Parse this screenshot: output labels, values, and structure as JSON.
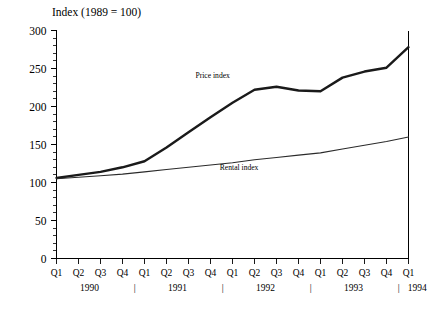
{
  "chart_data": {
    "type": "line",
    "title": "Index (1989 = 100)",
    "xlabel": "",
    "ylabel": "",
    "ylim": [
      0,
      300
    ],
    "ytick_step": 50,
    "yminor_step": 10,
    "grid": false,
    "legend_position": "inline-annotations",
    "categories": [
      "Q1 1990",
      "Q2 1990",
      "Q3 1990",
      "Q4 1990",
      "Q1 1991",
      "Q2 1991",
      "Q3 1991",
      "Q4 1991",
      "Q1 1992",
      "Q2 1992",
      "Q3 1992",
      "Q4 1992",
      "Q1 1993",
      "Q2 1993",
      "Q3 1993",
      "Q4 1993",
      "Q1 1994"
    ],
    "quarter_ticks": [
      "Q1",
      "Q2",
      "Q3",
      "Q4",
      "Q1",
      "Q2",
      "Q3",
      "Q4",
      "Q1",
      "Q2",
      "Q3",
      "Q4",
      "Q1",
      "Q2",
      "Q3",
      "Q4",
      "Q1"
    ],
    "yticks": [
      0,
      50,
      100,
      150,
      200,
      250,
      300
    ],
    "ytick_labels": [
      "0",
      "50",
      "100",
      "150",
      "200",
      "250",
      "300"
    ],
    "years": [
      {
        "label": "1990",
        "index": 1.5
      },
      {
        "label": "1991",
        "index": 5.5
      },
      {
        "label": "1992",
        "index": 9.5
      },
      {
        "label": "1993",
        "index": 13.5
      },
      {
        "label": "1994",
        "index": 16.4
      }
    ],
    "year_separators": [
      3.55,
      7.55,
      11.55,
      15.55
    ],
    "series": [
      {
        "name": "Price index",
        "color": "#1a1a1a",
        "linewidth": 2.4,
        "label_at_index": 7.1,
        "label_y_value": 238,
        "values": [
          106,
          110,
          114,
          120,
          128,
          146,
          166,
          186,
          205,
          222,
          226,
          221,
          220,
          238,
          246,
          251,
          278
        ]
      },
      {
        "name": "Rental index",
        "color": "#2a2a2a",
        "linewidth": 1.05,
        "label_at_index": 8.3,
        "label_y_value": 117,
        "values": [
          105,
          107,
          109,
          111,
          114,
          117,
          120,
          123,
          126,
          130,
          133,
          136,
          139,
          144,
          149,
          154,
          160
        ]
      }
    ]
  }
}
